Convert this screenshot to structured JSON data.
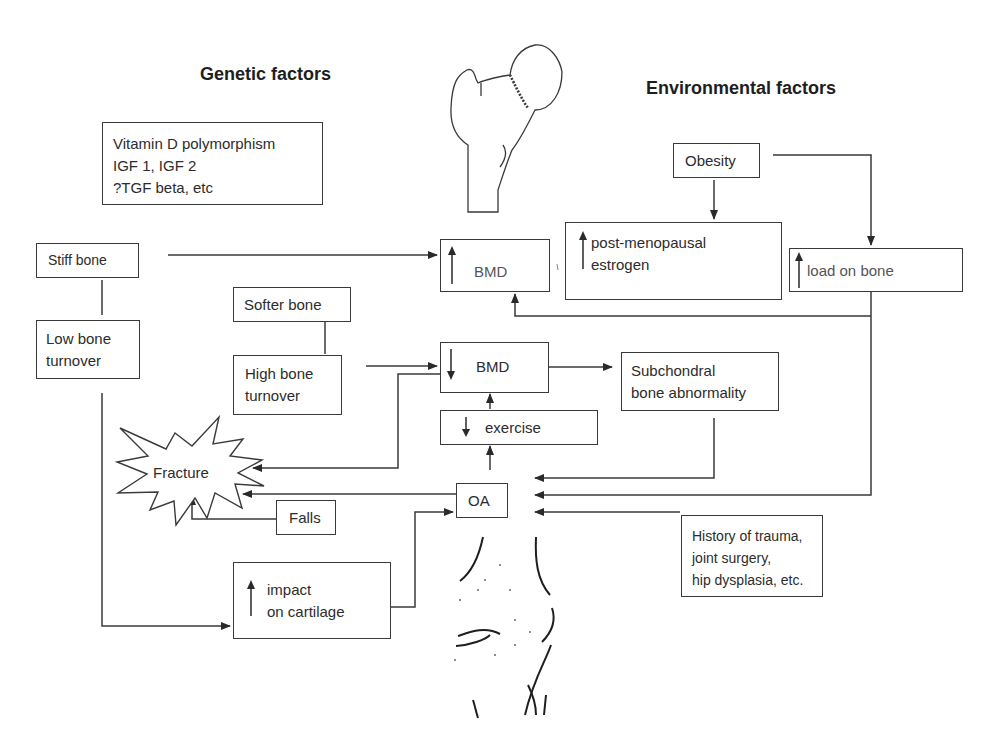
{
  "titles": {
    "genetic": "Genetic factors",
    "environmental": "Environmental factors"
  },
  "boxes": {
    "genetic_list": "Vitamin D polymorphism\nIGF 1, IGF 2\n?TGF beta, etc",
    "stiff_bone": "Stiff bone",
    "low_bone_turnover": "Low bone\nturnover",
    "softer_bone": "Softer bone",
    "high_bone_turnover": "High bone\nturnover",
    "bmd_up": "BMD",
    "bmd_down": "BMD",
    "exercise": "exercise",
    "subchondral": "Subchondral\nbone abnormality",
    "obesity": "Obesity",
    "post_menopausal": "post-menopausal\nestrogen",
    "load_on_bone": "load on bone",
    "falls": "Falls",
    "oa": "OA",
    "history": "History of trauma,\njoint surgery,\nhip dysplasia, etc.",
    "impact": "impact\non cartilage",
    "fracture": "Fracture"
  },
  "indicators": {
    "bmd_up": "increase-arrow",
    "post_menopausal": "increase-arrow",
    "load_on_bone": "increase-arrow",
    "bmd_down": "decrease-arrow",
    "exercise": "decrease-arrow",
    "impact": "increase-arrow"
  },
  "illustrations": {
    "top": "femur-hip-illustration",
    "bottom": "knee-joint-illustration"
  },
  "colors": {
    "line": "#3a3a3a",
    "text": "#2c2c2c",
    "background": "#ffffff"
  }
}
